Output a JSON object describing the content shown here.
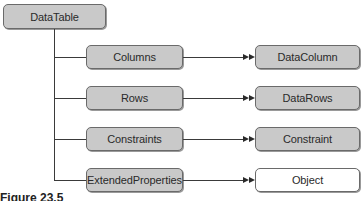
{
  "diagram": {
    "root": {
      "label": "DataTable"
    },
    "collections": [
      {
        "label": "Columns",
        "target": {
          "label": "DataColumn",
          "fill": "gray"
        }
      },
      {
        "label": "Rows",
        "target": {
          "label": "DataRows",
          "fill": "gray"
        }
      },
      {
        "label": "Constraints",
        "target": {
          "label": "Constraint",
          "fill": "gray"
        }
      },
      {
        "label": "ExtendedProperties",
        "target": {
          "label": "Object",
          "fill": "white"
        }
      }
    ],
    "colors": {
      "box_fill": "#c9c9c9",
      "box_border": "#6a6a6a",
      "line": "#3a3a3a",
      "white_fill": "#ffffff"
    }
  },
  "caption": "Figure 23.5"
}
